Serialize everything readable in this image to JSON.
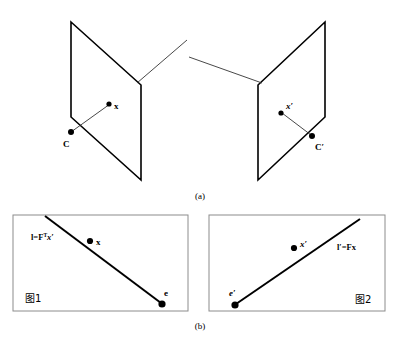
{
  "figure": {
    "stroke_color": "#000000",
    "thin_stroke_color": "#333333",
    "background_color": "#ffffff",
    "panel_border_color": "#888888"
  },
  "panel_a": {
    "caption": "(a)",
    "left_plane": {
      "name": "left image plane",
      "point_label": "x",
      "camera_label": "C"
    },
    "right_plane": {
      "name": "right image plane",
      "point_label": "x′",
      "camera_label": "C′"
    }
  },
  "panel_b": {
    "caption": "(b)",
    "left_box": {
      "line_label": "l=F",
      "line_label_sup": "T",
      "line_label_tail": "x′",
      "point_label": "x",
      "epipole_label": "e",
      "box_caption": "图1"
    },
    "right_box": {
      "line_label": "l′=Fx",
      "point_label": "x′",
      "epipole_label": "e′",
      "box_caption": "图2"
    }
  }
}
